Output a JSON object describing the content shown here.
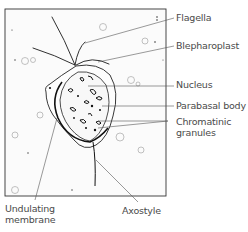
{
  "diagram": {
    "labels": {
      "flagella": "Flagella",
      "blepharoplast": "Blepharoplast",
      "nucleus": "Nucleus",
      "parabasal_body": "Parabasal body",
      "chromatinic_granules_line1": "Chromatinic",
      "chromatinic_granules_line2": "granules",
      "undulating_membrane_line1": "Undulating",
      "undulating_membrane_line2": "membrane",
      "axostyle": "Axostyle"
    },
    "colors": {
      "ink": "#1a1a1a",
      "leader": "#555555",
      "label": "#4a4a4a",
      "background": "#ffffff",
      "frame_fill": "#fbfbfb"
    }
  }
}
